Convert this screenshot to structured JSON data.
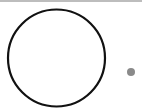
{
  "diagram": {
    "background": "#ffffff",
    "top_rule": {
      "color": "#bdbdbd",
      "height": 2
    },
    "shapes": [
      {
        "type": "circle",
        "name": "large-circle",
        "cx": 56.5,
        "cy": 58,
        "r": 48.5,
        "stroke": "#111111",
        "stroke_width": 2.2,
        "fill": "none"
      },
      {
        "type": "circle",
        "name": "small-dot",
        "cx": 131,
        "cy": 72,
        "r": 4,
        "stroke": "none",
        "fill": "#8a8a8a"
      }
    ]
  }
}
